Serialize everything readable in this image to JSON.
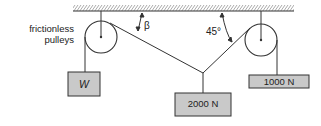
{
  "diagram": {
    "type": "statics-pulley-system",
    "labels": {
      "pulleys_line1": "frictionless",
      "pulleys_line2": "pulleys",
      "angle_left": "β",
      "angle_right": "45°"
    },
    "blocks": {
      "left": {
        "label": "W"
      },
      "center": {
        "label": "2000 N"
      },
      "right": {
        "label": "1000 N"
      }
    },
    "colors": {
      "block_fill": "#c9c9c9",
      "line": "#333333",
      "background": "#ffffff"
    }
  }
}
